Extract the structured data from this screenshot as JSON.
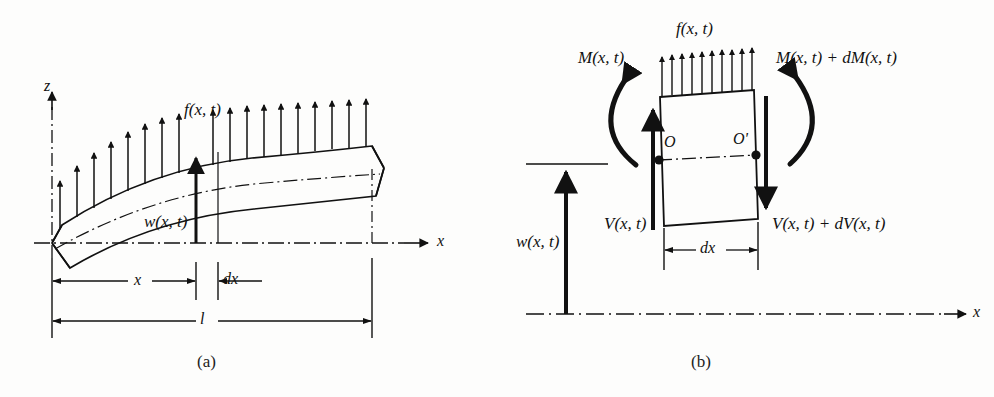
{
  "figure": {
    "background_color": "#fdfdfc",
    "ink_color": "#111111",
    "panels": [
      {
        "id": "a",
        "caption": "(a)",
        "labels": {
          "z_axis": "z",
          "x_axis": "x",
          "distributed_load": "f(x, t)",
          "deflection": "w(x, t)",
          "dim_x": "x",
          "dim_dx": "dx",
          "dim_length": "l"
        }
      },
      {
        "id": "b",
        "caption": "(b)",
        "labels": {
          "distributed_load": "f(x, t)",
          "moment_left": "M(x, t)",
          "moment_right": "M(x, t) + dM(x, t)",
          "shear_left": "V(x, t)",
          "shear_right": "V(x, t) + dV(x, t)",
          "deflection": "w(x, t)",
          "point_o": "O",
          "point_o_prime": "O'",
          "dim_dx": "dx",
          "x_axis": "x"
        }
      }
    ],
    "geometry": {
      "panel_a": {
        "axis_y": 243,
        "z_axis_x": 52,
        "beam_left_x": 52,
        "beam_right_x": 372,
        "station_x": 196,
        "station_dx": 218,
        "load_arrow_count": 19
      },
      "panel_b": {
        "element_left_x": 658,
        "element_right_x": 752,
        "element_top_y": 93,
        "element_bottom_y": 222,
        "neutral_y": 158,
        "axis_y": 314,
        "load_arrow_count": 10
      }
    }
  }
}
